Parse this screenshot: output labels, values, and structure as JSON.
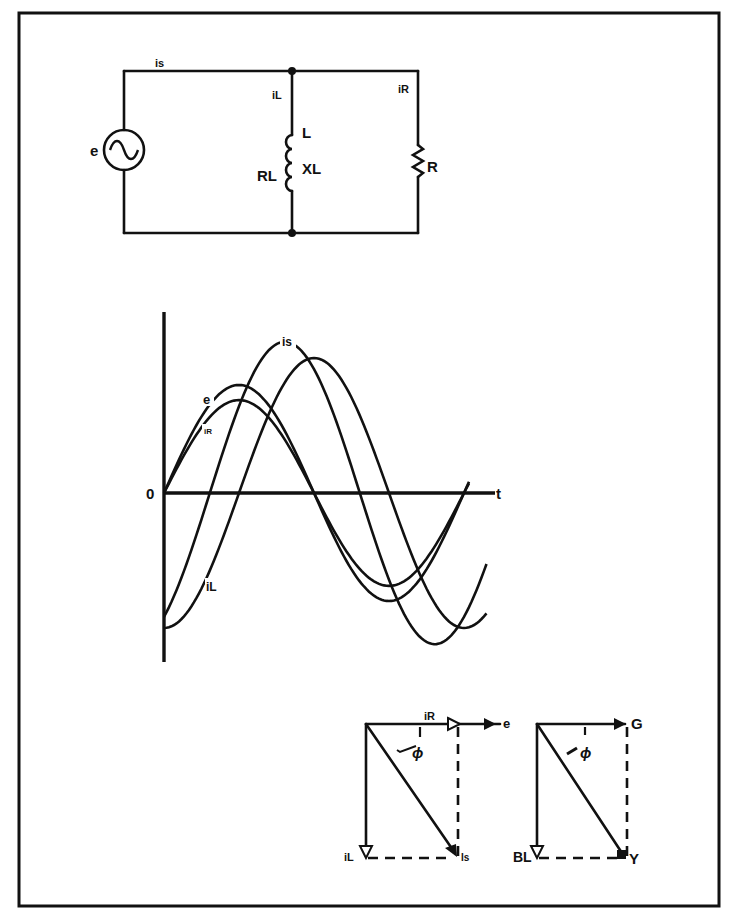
{
  "figure": {
    "frame": {
      "x": 19,
      "y": 13,
      "w": 700,
      "h": 893
    },
    "circuit": {
      "source_label": "e",
      "source_current_label": "is",
      "inductor_branch_current_label": "iL",
      "resistor_branch_current_label": "iR",
      "inductor_label": "L",
      "inductor_resistance_label": "RL",
      "inductive_reactance_label": "XL",
      "resistor_label": "R"
    },
    "waveforms": {
      "origin_label": "0",
      "time_axis_label": "t",
      "curve_labels": {
        "e": "e",
        "iR": "iR",
        "iL": "iL",
        "is": "is"
      }
    },
    "phasor_current": {
      "reference_label": "e",
      "horizontal_label": "iR",
      "vertical_label": "iL",
      "resultant_label": "Is",
      "angle_label": "ϕ"
    },
    "phasor_admittance": {
      "horizontal_label": "G",
      "vertical_label": "BL",
      "resultant_label": "Y",
      "angle_label": "ϕ"
    }
  },
  "chart_data": {
    "type": "line",
    "xlabel": "t",
    "ylabel": "",
    "x_origin_label": "0",
    "grid": false,
    "legend": "inline labels on curves",
    "units": "relative (amplitude normalized to e = 1.0, phase in degrees)",
    "x_range_deg": [
      0,
      420
    ],
    "series": [
      {
        "name": "e",
        "amplitude": 1.0,
        "phase_deg": 0
      },
      {
        "name": "iR",
        "amplitude": 0.86,
        "phase_deg": 0
      },
      {
        "name": "iL",
        "amplitude": 1.25,
        "phase_deg": -90
      },
      {
        "name": "is",
        "amplitude": 1.4,
        "phase_deg": -55
      }
    ]
  }
}
